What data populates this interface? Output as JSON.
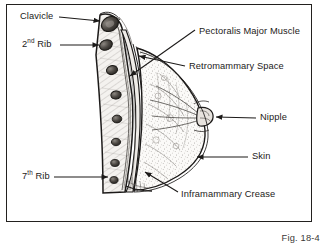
{
  "figure": {
    "caption": "Fig. 18-4",
    "frame_color": "#23211f",
    "background": "#ffffff",
    "ink_color": "#1c1a19"
  },
  "labels": {
    "clavicle": "Clavicle",
    "second_rib_prefix": "2",
    "second_rib_sup": "nd",
    "second_rib_suffix": " Rib",
    "seventh_rib_prefix": "7",
    "seventh_rib_sup": "th",
    "seventh_rib_suffix": " Rib",
    "pectoralis": "Pectoralis Major Muscle",
    "retromammary": "Retromammary Space",
    "nipple": "Nipple",
    "skin": "Skin",
    "inframammary": "Inframammary Crease"
  }
}
